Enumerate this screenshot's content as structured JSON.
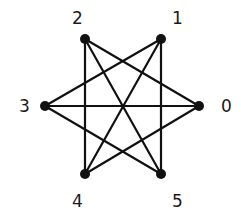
{
  "graph": {
    "nodes": [
      {
        "id": "0",
        "label": "0",
        "x": 199,
        "y": 106,
        "lx": 221,
        "ly": 112
      },
      {
        "id": "1",
        "label": "1",
        "x": 161,
        "y": 39,
        "lx": 172,
        "ly": 24
      },
      {
        "id": "2",
        "label": "2",
        "x": 85,
        "y": 39,
        "lx": 72,
        "ly": 24
      },
      {
        "id": "3",
        "label": "3",
        "x": 45,
        "y": 106,
        "lx": 19,
        "ly": 112
      },
      {
        "id": "4",
        "label": "4",
        "x": 85,
        "y": 174,
        "lx": 72,
        "ly": 207
      },
      {
        "id": "5",
        "label": "5",
        "x": 161,
        "y": 174,
        "lx": 172,
        "ly": 207
      }
    ],
    "edges": [
      [
        "0",
        "2"
      ],
      [
        "0",
        "3"
      ],
      [
        "0",
        "4"
      ],
      [
        "1",
        "3"
      ],
      [
        "1",
        "4"
      ],
      [
        "1",
        "5"
      ],
      [
        "2",
        "4"
      ],
      [
        "2",
        "5"
      ],
      [
        "3",
        "5"
      ]
    ],
    "colors": {
      "stroke": "#111111",
      "node": "#111111",
      "label": "#1a1a1a"
    }
  }
}
